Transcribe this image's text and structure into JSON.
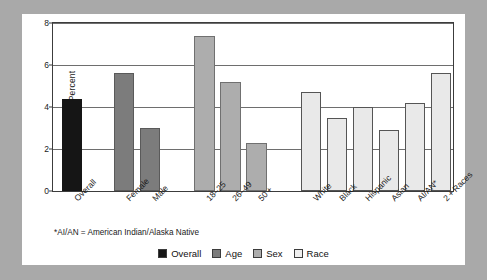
{
  "chart_data": {
    "type": "bar",
    "title": "",
    "subtitle": "",
    "xlabel": "",
    "ylabel": "Percent",
    "ylim": [
      0,
      8
    ],
    "yticks": [
      0,
      2,
      4,
      6,
      8
    ],
    "grid": true,
    "legend_position": "bottom-center",
    "footnote": "*AI/AN = American Indian/Alaska Native",
    "categories": [
      "Overall",
      "Female",
      "Male",
      "18–25",
      "26–49",
      "50 +",
      "White",
      "Black",
      "Hispanic",
      "Asian",
      "AI/AN*",
      "2 + Races"
    ],
    "values": [
      4.4,
      5.6,
      3.0,
      7.4,
      5.2,
      2.3,
      4.7,
      3.5,
      4.0,
      2.9,
      4.2,
      5.6
    ],
    "groups": [
      "Overall",
      "Sex",
      "Sex",
      "Age",
      "Age",
      "Age",
      "Race",
      "Race",
      "Race",
      "Race",
      "Race",
      "Race"
    ],
    "bars": [
      {
        "label": "Overall",
        "value": 4.4,
        "group": "Overall",
        "color": "#151515"
      },
      {
        "label": "Female",
        "value": 5.6,
        "group": "Sex",
        "color": "#7c7c7c"
      },
      {
        "label": "Male",
        "value": 3.0,
        "group": "Sex",
        "color": "#7c7c7c"
      },
      {
        "label": "18–25",
        "value": 7.4,
        "group": "Age",
        "color": "#adadad"
      },
      {
        "label": "26–49",
        "value": 5.2,
        "group": "Age",
        "color": "#adadad"
      },
      {
        "label": "50 +",
        "value": 2.3,
        "group": "Age",
        "color": "#adadad"
      },
      {
        "label": "White",
        "value": 4.7,
        "group": "Race",
        "color": "#e9e9e9"
      },
      {
        "label": "Black",
        "value": 3.5,
        "group": "Race",
        "color": "#e9e9e9"
      },
      {
        "label": "Hispanic",
        "value": 4.0,
        "group": "Race",
        "color": "#e9e9e9"
      },
      {
        "label": "Asian",
        "value": 2.9,
        "group": "Race",
        "color": "#e9e9e9"
      },
      {
        "label": "AI/AN*",
        "value": 4.2,
        "group": "Race",
        "color": "#e9e9e9"
      },
      {
        "label": "2 + Races",
        "value": 5.6,
        "group": "Race",
        "color": "#e9e9e9"
      }
    ],
    "legend": [
      {
        "label": "Overall",
        "color": "#151515"
      },
      {
        "label": "Age",
        "color": "#7c7c7c"
      },
      {
        "label": "Sex",
        "color": "#adadad"
      },
      {
        "label": "Race",
        "color": "#efefef"
      }
    ]
  }
}
